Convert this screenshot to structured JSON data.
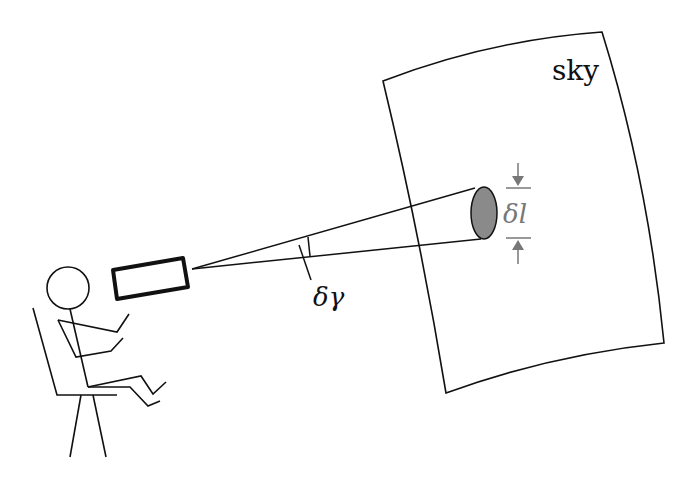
{
  "diagram": {
    "labels": {
      "sky": "sky",
      "angle": "δγ",
      "length": "δl"
    },
    "colors": {
      "stroke": "#111111",
      "dimension": "#777777",
      "spot_fill": "#8a8a8a",
      "background": "#ffffff"
    },
    "elements": [
      "observer",
      "chair",
      "telescope",
      "beam cone",
      "sky patch",
      "spot on sky"
    ]
  }
}
